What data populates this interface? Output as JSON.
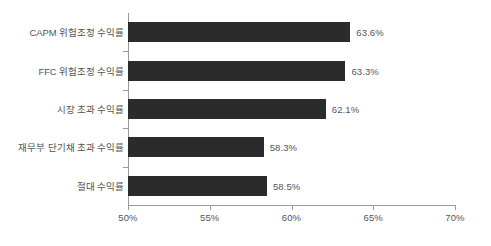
{
  "chart_data": {
    "type": "bar",
    "orientation": "horizontal",
    "title": "",
    "subtitle": "",
    "xlabel": "",
    "ylabel": "",
    "xlim": [
      50,
      70
    ],
    "xticks": [
      50,
      55,
      60,
      65,
      70
    ],
    "xticklabels": [
      "50%",
      "55%",
      "60%",
      "65%",
      "70%"
    ],
    "grid": false,
    "legend": null,
    "categories": [
      "CAPM 위험조정 수익률",
      "FFC 위험조정 수익률",
      "시장 초과 수익률",
      "재무부 단기채 초과 수익률",
      "절대 수익률"
    ],
    "values": [
      63.6,
      63.3,
      62.1,
      58.3,
      58.5
    ],
    "value_labels": [
      "63.6%",
      "63.3%",
      "62.1%",
      "58.3%",
      "58.5%"
    ],
    "bar_color": "#2b2b2b",
    "axis_color": "#9a9a9a",
    "text_color": "#555555",
    "background": "#ffffff"
  }
}
